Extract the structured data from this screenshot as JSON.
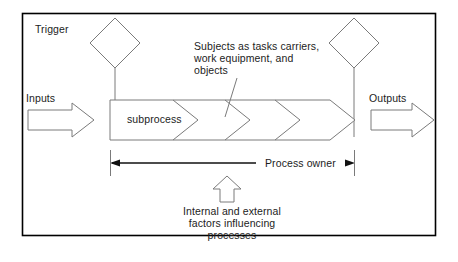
{
  "diagram": {
    "frame": {
      "border_color": "#000000"
    },
    "line_color": "#595959",
    "text_color": "#1c1c1c",
    "labels": {
      "trigger": "Trigger",
      "inputs": "Inputs",
      "outputs": "Outputs",
      "subprocess": "subprocess",
      "subjects": "Subjects as tasks carriers,\nwork equipment, and\nobjects",
      "process_owner": "Process owner",
      "influencing_factors": "Internal and external\nfactors influencing\nprocesses"
    },
    "shapes": {
      "start_diamond": "diamond",
      "end_diamond": "diamond",
      "input_arrow": "right-block-arrow",
      "output_arrow": "right-block-arrow",
      "process_arrow": "right-chevron-arrow",
      "chevron_dividers": 3,
      "factors_arrow": "up-block-arrow",
      "owner_span": "double-headed-arrow"
    }
  }
}
